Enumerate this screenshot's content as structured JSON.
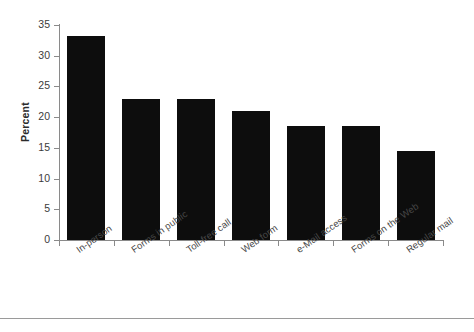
{
  "chart_data": {
    "type": "bar",
    "title": "",
    "xlabel": "",
    "ylabel": "Percent",
    "ylim": [
      0,
      35
    ],
    "yticks": [
      0,
      5,
      10,
      15,
      20,
      25,
      30,
      35
    ],
    "grid": false,
    "legend": null,
    "bar_color": "#0d0d0d",
    "categories": [
      "In-person",
      "Forms in public",
      "Toll-free call",
      "Web form",
      "e-Mail access",
      "Forms on the Web",
      "Regular mail"
    ],
    "values": [
      33.2,
      23.0,
      23.0,
      21.0,
      18.5,
      18.5,
      14.5
    ]
  }
}
